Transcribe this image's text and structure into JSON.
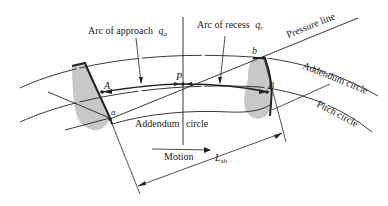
{
  "diagram": {
    "labels": {
      "arc_approach": "Arc of approach",
      "arc_approach_symbol": "q",
      "arc_approach_sub": "a",
      "arc_recess": "Arc of recess",
      "arc_recess_symbol": "q",
      "arc_recess_sub": "r",
      "pressure_line": "Pressure line",
      "addendum_circle_right": "Addendum circle",
      "pitch_circle": "Pitch circle",
      "addendum_circle_bottom_a": "Addendum",
      "addendum_circle_bottom_b": "circle",
      "motion": "Motion",
      "length_symbol": "L",
      "length_sub": "ab"
    },
    "points": {
      "A": "A",
      "a": "a",
      "P": "P",
      "b": "b",
      "B": "B"
    },
    "colors": {
      "line": "#222222",
      "tooth_fill": "#c8c8c8"
    }
  }
}
